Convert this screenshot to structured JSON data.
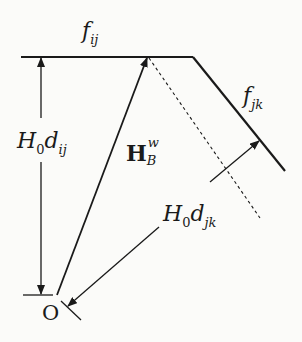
{
  "diagram": {
    "labels": {
      "f_ij": {
        "base": "f",
        "sub": "ij"
      },
      "f_jk": {
        "base": "f",
        "sub": "jk"
      },
      "H0_dij": {
        "H": "H",
        "H_sub": "0",
        "d": "d",
        "d_sub": "ij"
      },
      "H0_djk": {
        "H": "H",
        "H_sub": "0",
        "d": "d",
        "d_sub": "jk"
      },
      "HBw": {
        "base": "H",
        "sup": "w",
        "sub": "B"
      },
      "origin": "O"
    },
    "colors": {
      "stroke": "#1a1a1a",
      "background": "#fbfbf9"
    }
  }
}
